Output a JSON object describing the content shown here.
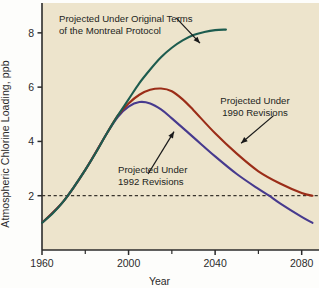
{
  "chart_data": {
    "type": "line",
    "title": "",
    "xlabel": "Year",
    "ylabel": "Atmospheric Chlorine Loading, ppb",
    "xlim": [
      1960,
      2088
    ],
    "ylim": [
      0,
      9.1
    ],
    "xticks": [
      1960,
      2000,
      2040,
      2080
    ],
    "xticks_minor": [
      1980,
      2020,
      2060
    ],
    "yticks": [
      2,
      4,
      6,
      8
    ],
    "grid": false,
    "legend": "none (inline annotations with arrows)",
    "background_color": "#EDE4CC",
    "reference_lines": [
      {
        "name": "two-ppb-threshold",
        "axis": "y",
        "value": 2,
        "style": "dashed",
        "color": "#3a352e"
      }
    ],
    "series": [
      {
        "name": "Projected Under Original Terms of the Montreal Protocol",
        "color": "#1d5c4f",
        "points": [
          [
            1960,
            1.0
          ],
          [
            1965,
            1.35
          ],
          [
            1970,
            1.8
          ],
          [
            1975,
            2.35
          ],
          [
            1980,
            2.95
          ],
          [
            1985,
            3.6
          ],
          [
            1990,
            4.3
          ],
          [
            1995,
            4.95
          ],
          [
            2000,
            5.55
          ],
          [
            2005,
            6.15
          ],
          [
            2010,
            6.65
          ],
          [
            2015,
            7.1
          ],
          [
            2020,
            7.45
          ],
          [
            2025,
            7.72
          ],
          [
            2030,
            7.92
          ],
          [
            2035,
            8.03
          ],
          [
            2040,
            8.1
          ],
          [
            2045,
            8.12
          ]
        ]
      },
      {
        "name": "Projected Under 1990 Revisions",
        "color": "#9b2d18",
        "points": [
          [
            1960,
            1.0
          ],
          [
            1970,
            1.8
          ],
          [
            1980,
            2.95
          ],
          [
            1990,
            4.3
          ],
          [
            1995,
            4.95
          ],
          [
            2000,
            5.4
          ],
          [
            2005,
            5.72
          ],
          [
            2010,
            5.9
          ],
          [
            2015,
            5.95
          ],
          [
            2020,
            5.85
          ],
          [
            2025,
            5.55
          ],
          [
            2030,
            5.15
          ],
          [
            2040,
            4.3
          ],
          [
            2050,
            3.55
          ],
          [
            2060,
            2.9
          ],
          [
            2070,
            2.45
          ],
          [
            2080,
            2.1
          ],
          [
            2085,
            2.0
          ]
        ]
      },
      {
        "name": "Projected Under 1992 Revisions",
        "color": "#473a8e",
        "points": [
          [
            1960,
            1.0
          ],
          [
            1970,
            1.8
          ],
          [
            1980,
            2.95
          ],
          [
            1990,
            4.3
          ],
          [
            1995,
            4.9
          ],
          [
            2000,
            5.28
          ],
          [
            2005,
            5.45
          ],
          [
            2010,
            5.4
          ],
          [
            2015,
            5.18
          ],
          [
            2020,
            4.85
          ],
          [
            2030,
            4.15
          ],
          [
            2040,
            3.45
          ],
          [
            2050,
            2.8
          ],
          [
            2060,
            2.25
          ],
          [
            2065,
            2.0
          ],
          [
            2070,
            1.72
          ],
          [
            2080,
            1.22
          ],
          [
            2085,
            1.0
          ]
        ]
      }
    ],
    "annotations": [
      {
        "name": "annotation-original-terms",
        "lines": [
          "Projected Under Original Terms",
          "of the Montreal Protocol"
        ],
        "arrow_from": [
          2022,
          8.55
        ],
        "arrow_to": [
          2033,
          7.62
        ]
      },
      {
        "name": "annotation-1990-revisions",
        "lines": [
          "Projected Under",
          "1990 Revisions"
        ],
        "arrow_from": [
          2067,
          4.95
        ],
        "arrow_to": [
          2052,
          3.93
        ]
      },
      {
        "name": "annotation-1992-revisions",
        "lines": [
          "Projected Under",
          "1992 Revisions"
        ],
        "arrow_from": [
          2009,
          2.8
        ],
        "arrow_to": [
          2021,
          4.36
        ]
      }
    ]
  }
}
